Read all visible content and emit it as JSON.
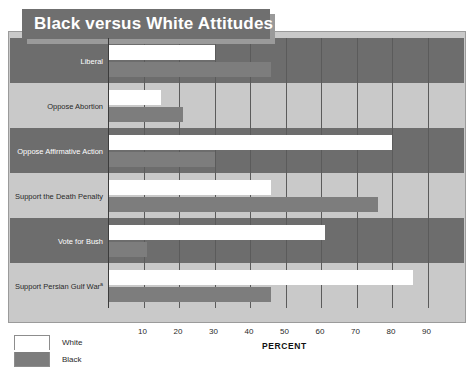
{
  "title": "Black versus White Attitudes",
  "axis_title": "PERCENT",
  "legend": {
    "white_label": "White",
    "black_label": "Black"
  },
  "colors": {
    "title_band": "#6f6f6f",
    "title_shadow": "#9a9a9a",
    "band_dark": "#6d6d6d",
    "band_light": "#c9c9c9",
    "bar_white": "#ffffff",
    "bar_black": "#7d7d7d",
    "gridline": "#5b5b5b"
  },
  "chart_data": {
    "type": "bar",
    "orientation": "horizontal",
    "title": "Black versus White Attitudes",
    "xlabel": "PERCENT",
    "ylabel": "",
    "xlim": [
      0,
      100
    ],
    "xticks": [
      10,
      20,
      30,
      40,
      50,
      60,
      70,
      80,
      90
    ],
    "xtick_labels": [
      "10",
      "20",
      "30",
      "40",
      "50",
      "60",
      "70",
      "80",
      "90"
    ],
    "grid": true,
    "legend_position": "bottom-left",
    "categories": [
      "Liberal",
      "Oppose Abortion",
      "Oppose Affirmative Action",
      "Support the Death Penalty",
      "Vote for Bush",
      "Support Persian Gulf War"
    ],
    "category_footnotes": [
      "",
      "",
      "",
      "",
      "",
      "a"
    ],
    "series": [
      {
        "name": "White",
        "values": [
          30,
          15,
          80,
          46,
          61,
          86
        ]
      },
      {
        "name": "Black",
        "values": [
          46,
          21,
          30,
          76,
          11,
          46
        ]
      }
    ]
  }
}
